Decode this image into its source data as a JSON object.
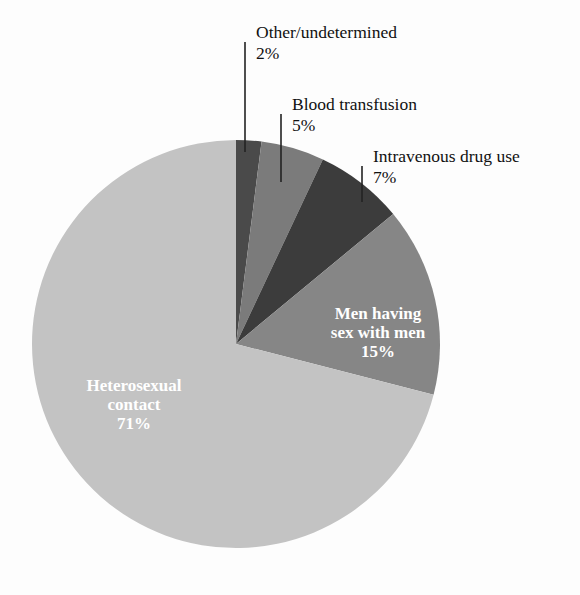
{
  "chart_data": {
    "type": "pie",
    "title": "",
    "subtitle": "",
    "xlabel": "",
    "ylabel": "",
    "legend_position": "none",
    "grid": false,
    "units": "percent",
    "start_angle_deg": 0,
    "direction": "clockwise",
    "categories": [
      "Other/undetermined",
      "Blood transfusion",
      "Intravenous drug use",
      "Men having sex with men",
      "Heterosexual contact"
    ],
    "values": [
      2,
      5,
      7,
      15,
      71
    ],
    "slices": [
      {
        "label": "Other/undetermined",
        "value": 2,
        "value_text": "2%",
        "color": "#4a4a4a",
        "label_placement": "callout",
        "label_text_color": "#111111"
      },
      {
        "label": "Blood transfusion",
        "value": 5,
        "value_text": "5%",
        "color": "#7b7b7b",
        "label_placement": "callout",
        "label_text_color": "#111111"
      },
      {
        "label": "Intravenous drug use",
        "value": 7,
        "value_text": "7%",
        "color": "#3c3c3c",
        "label_placement": "callout",
        "label_text_color": "#111111"
      },
      {
        "label": "Men having sex with men",
        "value": 15,
        "value_text": "15%",
        "color": "#868686",
        "label_placement": "inside",
        "label_text_color": "#ffffff"
      },
      {
        "label": "Heterosexual contact",
        "value": 71,
        "value_text": "71%",
        "color": "#c3c3c3",
        "label_placement": "inside",
        "label_text_color": "#ffffff"
      }
    ]
  },
  "callouts": {
    "other": {
      "line1": "Other/undetermined",
      "pct": "2%"
    },
    "blood": {
      "line1": "Blood transfusion",
      "pct": "5%"
    },
    "ivdu": {
      "line1": "Intravenous drug use",
      "pct": "7%"
    }
  },
  "inside_labels": {
    "msm": {
      "line1": "Men having",
      "line2": "sex with men",
      "pct": "15%"
    },
    "hetero": {
      "line1": "Heterosexual",
      "line2": "contact",
      "pct": "71%"
    }
  },
  "colors": {
    "background": "#fdfdfd",
    "text": "#111111",
    "inside_label": "#ffffff",
    "leader_line": "#222222"
  }
}
